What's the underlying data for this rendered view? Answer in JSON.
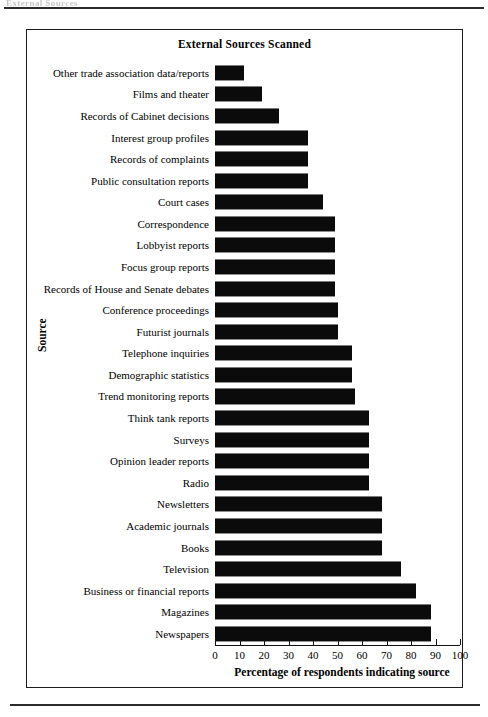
{
  "page": {
    "header_text": "External Sources",
    "header_rule": true,
    "footer_rule": true
  },
  "figure": {
    "title": "External Sources Scanned",
    "x_axis_title": "Percentage of respondents indicating source",
    "y_axis_title": "Source"
  },
  "chart_data": {
    "type": "bar",
    "orientation": "horizontal",
    "title": "External Sources Scanned",
    "xlabel": "Percentage of respondents indicating source",
    "ylabel": "Source",
    "xlim": [
      0,
      100
    ],
    "grid": false,
    "legend": null,
    "bar_color": "#0b0b0b",
    "xticks": [
      0,
      10,
      20,
      30,
      40,
      50,
      60,
      70,
      80,
      90,
      100
    ],
    "xtick_labels": [
      "0",
      "10",
      "20",
      "30",
      "40",
      "50",
      "60",
      "70",
      "80",
      "90",
      "100"
    ],
    "categories": [
      "Other trade association data/reports",
      "Films and theater",
      "Records of Cabinet decisions",
      "Interest group profiles",
      "Records of complaints",
      "Public consultation reports",
      "Court cases",
      "Correspondence",
      "Lobbyist reports",
      "Focus group reports",
      "Records of House and Senate debates",
      "Conference proceedings",
      "Futurist journals",
      "Telephone inquiries",
      "Demographic statistics",
      "Trend monitoring reports",
      "Think tank reports",
      "Surveys",
      "Opinion leader reports",
      "Radio",
      "Newsletters",
      "Academic journals",
      "Books",
      "Television",
      "Business or financial reports",
      "Magazines",
      "Newspapers"
    ],
    "values": [
      12,
      19,
      26,
      38,
      38,
      38,
      44,
      49,
      49,
      49,
      49,
      50,
      50,
      56,
      56,
      57,
      63,
      63,
      63,
      63,
      68,
      68,
      68,
      76,
      82,
      88,
      88
    ]
  }
}
